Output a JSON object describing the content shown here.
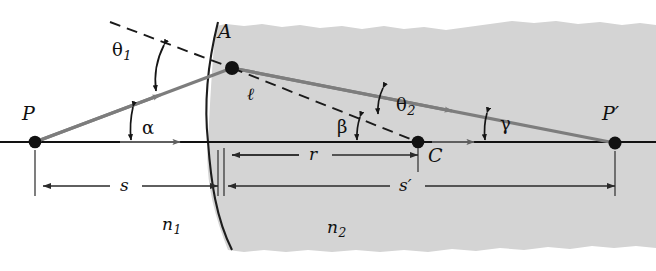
{
  "figure": {
    "colors": {
      "medium_shade": "#d4d4d4",
      "ray_gray": "#7d7d7d",
      "axis_black": "#121212",
      "dashed_black": "#1a1a1a",
      "label_black": "#101010",
      "page_white": "#ffffff"
    }
  },
  "points": {
    "object_point": {
      "label": "P",
      "x": 35,
      "y": 142
    },
    "surface_point": {
      "label": "A",
      "x": 232,
      "y": 68
    },
    "center_of_curvature": {
      "label": "C",
      "x": 418,
      "y": 142
    },
    "image_point": {
      "label": "P",
      "prime": "′",
      "x": 615,
      "y": 143
    }
  },
  "angles": [
    {
      "name": "theta1",
      "label": "θ",
      "sub": "1",
      "x": 112,
      "y": 50,
      "meaning": "angle of incidence"
    },
    {
      "name": "alpha",
      "label": "α",
      "sub": "",
      "x": 120,
      "y": 128,
      "meaning": "object ray angle to axis"
    },
    {
      "name": "theta2",
      "label": "θ",
      "sub": "2",
      "x": 393,
      "y": 105,
      "meaning": "angle of refraction"
    },
    {
      "name": "beta",
      "label": "β",
      "sub": "",
      "x": 340,
      "y": 124,
      "meaning": "radius angle to axis"
    },
    {
      "name": "gamma",
      "label": "γ",
      "sub": "",
      "x": 497,
      "y": 122,
      "meaning": "image ray angle to axis"
    }
  ],
  "dimensions": [
    {
      "name": "r",
      "label": "r",
      "prime": "",
      "x1": 224,
      "x2": 418,
      "y": 155,
      "text_x": 315,
      "text_y": 146,
      "meaning": "radius of curvature"
    },
    {
      "name": "s",
      "label": "s",
      "prime": "",
      "x1": 35,
      "x2": 218,
      "y": 186,
      "text_x": 124,
      "text_y": 177,
      "meaning": "object distance"
    },
    {
      "name": "sp",
      "label": "s",
      "prime": "′",
      "x1": 224,
      "x2": 615,
      "y": 186,
      "text_x": 405,
      "text_y": 177,
      "meaning": "image distance"
    }
  ],
  "media": [
    {
      "name": "n1",
      "label": "n",
      "sub": "1",
      "x": 168,
      "y": 225,
      "meaning": "index of refraction, left medium"
    },
    {
      "name": "n2",
      "label": "n",
      "sub": "2",
      "x": 333,
      "y": 228,
      "meaning": "index of refraction, right medium"
    }
  ],
  "segment_label": {
    "name": "ell",
    "label": "ℓ",
    "x": 247,
    "y": 96,
    "meaning": "object ray path length P to A"
  },
  "axis": {
    "y": 142,
    "x_start": 0,
    "x_end": 656
  }
}
